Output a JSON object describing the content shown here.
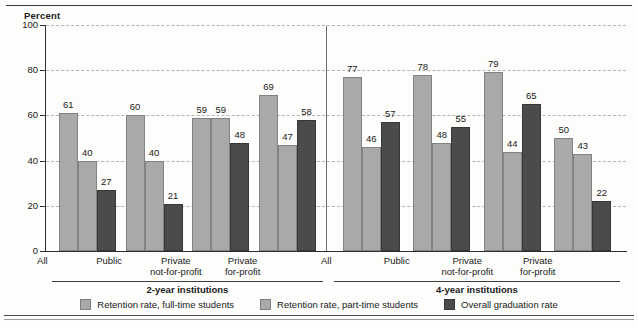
{
  "chart_data": {
    "type": "bar",
    "title": "",
    "ylabel": "Percent",
    "xlabel": "",
    "ylim": [
      0,
      100
    ],
    "yticks": [
      0,
      20,
      40,
      60,
      80,
      100
    ],
    "grid": "horizontal-dashed",
    "legend_position": "bottom",
    "categories": [
      "All",
      "Public",
      "Private not-for-profit",
      "Private for-profit",
      "All",
      "Public",
      "Private not-for-profit",
      "Private for-profit"
    ],
    "series": [
      {
        "name": "Retention rate, full-time students",
        "color": "#a9a9a9",
        "values": [
          61,
          60,
          59,
          69,
          77,
          78,
          79,
          50
        ]
      },
      {
        "name": "Retention rate, part-time students",
        "color": "#a9a9a9",
        "values": [
          40,
          40,
          59,
          47,
          46,
          48,
          44,
          43
        ]
      },
      {
        "name": "Overall graduation rate",
        "color": "#4b4b4b",
        "values": [
          27,
          21,
          48,
          58,
          57,
          55,
          65,
          22
        ]
      }
    ],
    "groups": [
      {
        "label": "2-year institutions",
        "categories": [
          {
            "line1": "All",
            "line2": ""
          },
          {
            "line1": "Public",
            "line2": ""
          },
          {
            "line1": "Private",
            "line2": "not-for-profit"
          },
          {
            "line1": "Private",
            "line2": "for-profit"
          }
        ],
        "bars": [
          {
            "values": [
              61,
              40,
              27
            ]
          },
          {
            "values": [
              60,
              40,
              21
            ]
          },
          {
            "values": [
              59,
              59,
              48
            ]
          },
          {
            "values": [
              69,
              47,
              58
            ]
          }
        ]
      },
      {
        "label": "4-year institutions",
        "categories": [
          {
            "line1": "All",
            "line2": ""
          },
          {
            "line1": "Public",
            "line2": ""
          },
          {
            "line1": "Private",
            "line2": "not-for-profit"
          },
          {
            "line1": "Private",
            "line2": "for-profit"
          }
        ],
        "bars": [
          {
            "values": [
              77,
              46,
              57
            ]
          },
          {
            "values": [
              78,
              48,
              55
            ]
          },
          {
            "values": [
              79,
              44,
              65
            ]
          },
          {
            "values": [
              50,
              43,
              22
            ]
          }
        ]
      }
    ]
  },
  "axis": {
    "y_title": "Percent",
    "y_tick_labels": [
      "100",
      "80",
      "60",
      "40",
      "20",
      "0"
    ]
  },
  "legend": {
    "items": [
      {
        "label": "Retention rate, full-time students",
        "series": 1
      },
      {
        "label": "Retention rate, part-time students",
        "series": 2
      },
      {
        "label": "Overall graduation rate",
        "series": 3
      }
    ]
  }
}
